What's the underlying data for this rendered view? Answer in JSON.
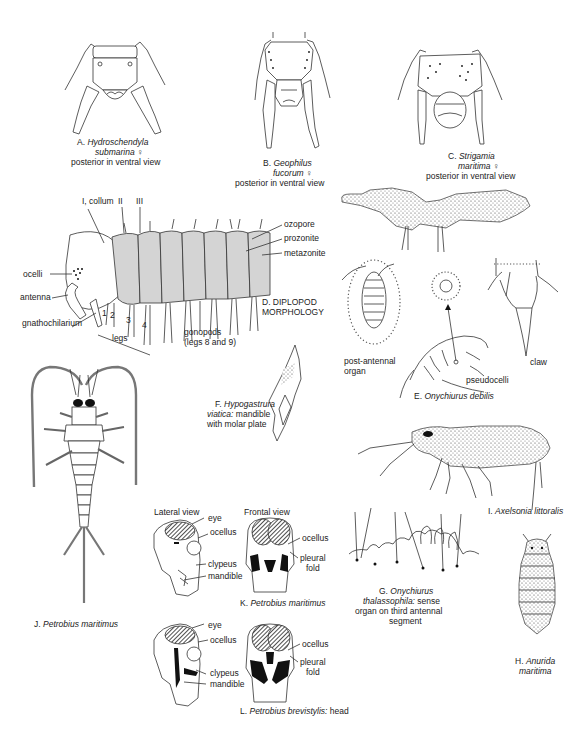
{
  "figures": {
    "A": {
      "letter": "A.",
      "species_1": "Hydroschendyla",
      "species_2": "submarina",
      "sex": "♀",
      "note": "posterior in ventral view"
    },
    "B": {
      "letter": "B.",
      "species_1": "Geophilus",
      "species_2": "fucorum",
      "sex": "♀",
      "note": "posterior in ventral view"
    },
    "C": {
      "letter": "C.",
      "species_1": "Strigamia",
      "species_2": "maritima",
      "sex": "♀",
      "note": "posterior in ventral view"
    },
    "D": {
      "caption_1": "D. DIPLOPOD",
      "caption_2": "MORPHOLOGY",
      "labels": {
        "collum": "I, collum",
        "seg2": "II",
        "seg3": "III",
        "ozopore": "ozopore",
        "prozonite": "prozonite",
        "metazonite": "metazonite",
        "ocelli": "ocelli",
        "antenna": "antenna",
        "gnathochilarium": "gnathochilarium",
        "legs": "legs",
        "leg1": "1",
        "leg2": "2",
        "leg3": "3",
        "leg4": "4",
        "gonopods_1": "gonopods",
        "gonopods_2": "(legs 8 and 9)"
      }
    },
    "E": {
      "letter": "E.",
      "species": "Onychiurus debilis",
      "labels": {
        "post_antennal_1": "post-antennal",
        "post_antennal_2": "organ",
        "claw": "claw",
        "pseudocelli": "pseudocelli"
      }
    },
    "F": {
      "letter": "F.",
      "species_1": "Hypogastrura",
      "species_2": "viatica:",
      "note_1": "mandible",
      "note_2": "with molar plate"
    },
    "G": {
      "letter": "G.",
      "species_1": "Onychiurus",
      "species_2": "thalassophila:",
      "note_1": "sense",
      "note_2": "organ on third antennal",
      "note_3": "segment"
    },
    "H": {
      "letter": "H.",
      "species_1": "Anurida",
      "species_2": "maritima"
    },
    "I": {
      "letter": "I.",
      "species": "Axelsonia littoralis"
    },
    "J": {
      "letter": "J.",
      "species": "Petrobius maritimus"
    },
    "K": {
      "letter": "K.",
      "species": "Petrobius maritimus",
      "view_lateral": "Lateral view",
      "view_frontal": "Frontal view",
      "labels": {
        "eye": "eye",
        "ocellus_l": "ocellus",
        "ocellus_r": "ocellus",
        "clypeus": "clypeus",
        "mandible": "mandible",
        "pleural_1": "pleural",
        "pleural_2": "fold"
      }
    },
    "L": {
      "letter": "L.",
      "species": "Petrobius brevistylis:",
      "note": "head",
      "labels": {
        "eye": "eye",
        "ocellus_l": "ocellus",
        "ocellus_r": "ocellus",
        "clypeus": "clypeus",
        "mandible": "mandible",
        "pleural_1": "pleural",
        "pleural_2": "fold"
      }
    }
  }
}
